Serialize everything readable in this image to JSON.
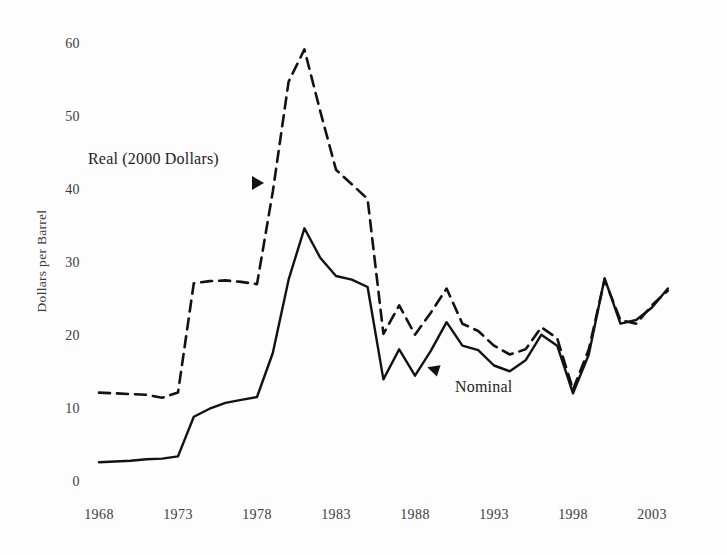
{
  "chart_data": {
    "type": "line",
    "title": "",
    "subtitle": "",
    "xlabel": "",
    "ylabel": "Dollars per Barrel",
    "xlim": [
      1968,
      2004
    ],
    "ylim": [
      0,
      60
    ],
    "grid": false,
    "legend_position": "inline-annotations",
    "xticks": [
      "1968",
      "1973",
      "1978",
      "1983",
      "1988",
      "1993",
      "1998",
      "2003"
    ],
    "xtick_values": [
      1968,
      1973,
      1978,
      1983,
      1988,
      1993,
      1998,
      2003
    ],
    "yticks": [
      "0",
      "10",
      "20",
      "30",
      "40",
      "50",
      "60"
    ],
    "ytick_values": [
      0,
      10,
      20,
      30,
      40,
      50,
      60
    ],
    "x": [
      1968,
      1969,
      1970,
      1971,
      1972,
      1973,
      1974,
      1975,
      1976,
      1977,
      1978,
      1979,
      1980,
      1981,
      1982,
      1983,
      1984,
      1985,
      1986,
      1987,
      1988,
      1989,
      1990,
      1991,
      1992,
      1993,
      1994,
      1995,
      1996,
      1997,
      1998,
      1999,
      2000,
      2001,
      2002,
      2003,
      2004
    ],
    "series": [
      {
        "name": "Real (2000 Dollars)",
        "style": "dashed",
        "color": "#121212",
        "values": [
          12.6,
          12.5,
          12.4,
          12.3,
          11.9,
          12.6,
          27.5,
          27.8,
          27.9,
          27.7,
          27.4,
          40.0,
          55.0,
          59.4,
          51.0,
          43.0,
          41.0,
          39.0,
          20.6,
          24.5,
          20.5,
          23.5,
          26.8,
          22.0,
          21.0,
          19.0,
          17.8,
          18.5,
          21.5,
          20.0,
          13.0,
          18.5,
          28.0,
          22.5,
          22.0,
          24.5,
          26.5
        ]
      },
      {
        "name": "Nominal",
        "style": "solid",
        "color": "#121212",
        "values": [
          3.1,
          3.2,
          3.3,
          3.5,
          3.6,
          3.9,
          9.3,
          10.4,
          11.2,
          11.6,
          12.0,
          18.0,
          28.0,
          35.0,
          31.0,
          28.5,
          28.0,
          27.0,
          14.4,
          18.5,
          14.9,
          18.3,
          22.2,
          19.0,
          18.4,
          16.3,
          15.5,
          17.0,
          20.5,
          19.0,
          12.5,
          17.8,
          28.2,
          22.0,
          22.5,
          24.2,
          26.8
        ]
      }
    ]
  },
  "annotations": {
    "real_label": "Real (2000 Dollars)",
    "nominal_label": "Nominal"
  },
  "axis": {
    "y_title": "Dollars per Barrel"
  }
}
